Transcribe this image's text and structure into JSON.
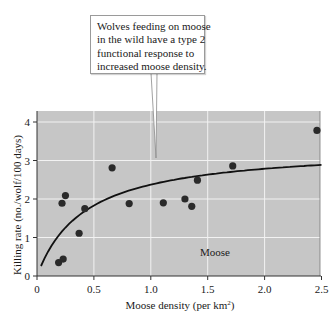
{
  "callout": {
    "lines": [
      "Wolves feeding on moose",
      "in the wild have a type 2",
      "functional response to",
      "increased moose density."
    ]
  },
  "axes": {
    "xlabel_main": "Moose density (per km",
    "xlabel_sup": "2",
    "xlabel_close": ")",
    "ylabel": "Killing rate (no./wolf/100 days)",
    "xticks": [
      "0",
      "0.5",
      "1.0",
      "1.5",
      "2.0",
      "2.5"
    ],
    "yticks": [
      "0",
      "1",
      "2",
      "3",
      "4"
    ]
  },
  "series_label": "Moose",
  "colors": {
    "plot_bg": "#c6c6c6",
    "grid": "#f2f2f2",
    "points": "#2a2a2a",
    "curve": "#111111"
  },
  "chart_data": {
    "type": "scatter",
    "title": "",
    "annotation": "Wolves feeding on moose in the wild have a type 2 functional response to increased moose density.",
    "xlabel": "Moose density (per km²)",
    "ylabel": "Killing rate (no./wolf/100 days)",
    "xlim": [
      0,
      2.5
    ],
    "ylim": [
      0,
      4.3
    ],
    "xticks": [
      0,
      0.5,
      1.0,
      1.5,
      2.0,
      2.5
    ],
    "yticks": [
      0,
      1,
      2,
      3,
      4
    ],
    "grid": true,
    "legend": "none; in-plot label 'Moose'",
    "series": [
      {
        "name": "Moose",
        "kind": "scatter",
        "points": [
          {
            "x": 0.19,
            "y": 0.35
          },
          {
            "x": 0.23,
            "y": 0.44
          },
          {
            "x": 0.22,
            "y": 1.89
          },
          {
            "x": 0.25,
            "y": 2.09
          },
          {
            "x": 0.37,
            "y": 1.11
          },
          {
            "x": 0.42,
            "y": 1.75
          },
          {
            "x": 0.66,
            "y": 2.81
          },
          {
            "x": 0.81,
            "y": 1.88
          },
          {
            "x": 1.11,
            "y": 1.9
          },
          {
            "x": 1.3,
            "y": 2.0
          },
          {
            "x": 1.36,
            "y": 1.81
          },
          {
            "x": 1.41,
            "y": 2.49
          },
          {
            "x": 1.72,
            "y": 2.86
          },
          {
            "x": 2.46,
            "y": 3.78
          }
        ]
      },
      {
        "name": "Type 2 functional response fit",
        "kind": "line",
        "model": "y = a*x/(b+x)",
        "a": 3.37,
        "b": 0.42,
        "x_range": [
          0.035,
          2.5
        ]
      }
    ]
  }
}
